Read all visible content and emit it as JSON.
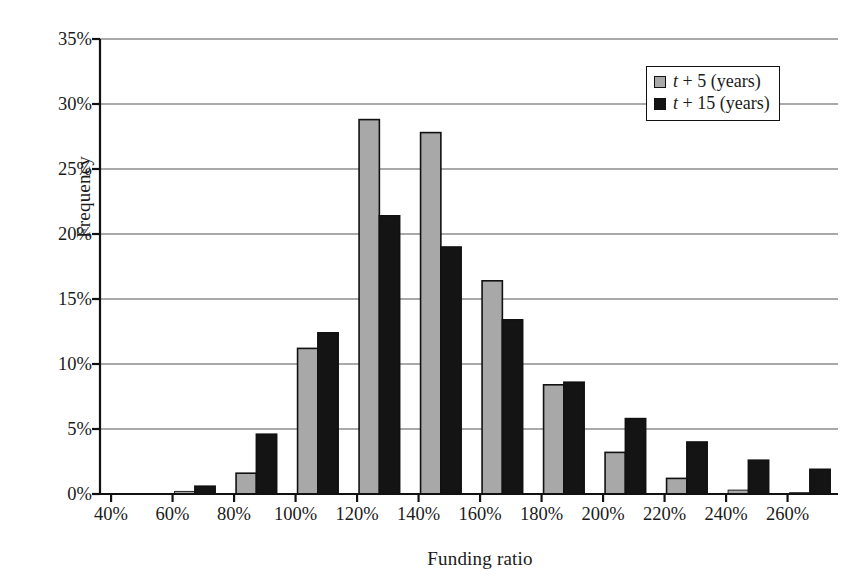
{
  "chart_data": {
    "type": "bar",
    "title": "",
    "xlabel": "Funding ratio",
    "ylabel": "Frequency",
    "categories": [
      "40%",
      "60%",
      "80%",
      "100%",
      "120%",
      "140%",
      "160%",
      "180%",
      "200%",
      "220%",
      "240%",
      "260%"
    ],
    "series": [
      {
        "name": "t + 5 (years)",
        "color": "#a8a8a8",
        "edge_color": "#111111",
        "values": [
          0.0,
          0.2,
          1.6,
          11.2,
          28.8,
          27.8,
          16.4,
          8.4,
          3.2,
          1.2,
          0.3,
          0.1
        ]
      },
      {
        "name": "t + 15 (years)",
        "color": "#141414",
        "edge_color": "#111111",
        "values": [
          0.0,
          0.6,
          4.6,
          12.4,
          21.4,
          19.0,
          13.4,
          8.6,
          5.8,
          4.0,
          2.6,
          1.9
        ]
      }
    ],
    "ylim": [
      0,
      35
    ],
    "ytick_values": [
      0,
      5,
      10,
      15,
      20,
      25,
      30,
      35
    ],
    "ytick_labels": [
      "0%",
      "5%",
      "10%",
      "15%",
      "20%",
      "25%",
      "30%",
      "35%"
    ],
    "grid": true,
    "grid_axis": "y",
    "legend_position": "upper-right",
    "value_unit": "%"
  },
  "legend": {
    "items": [
      {
        "label_prefix": "t",
        "label_rest": " + 5 (years)",
        "full": "t + 5 (years)",
        "swatch": "gray-swatch"
      },
      {
        "label_prefix": "t",
        "label_rest": " + 15 (years)",
        "full": "t + 15 (years)",
        "swatch": "black-swatch"
      }
    ]
  },
  "colors": {
    "series_1": "#a8a8a8",
    "series_2": "#141414",
    "axis": "#111111",
    "grid": "#555555",
    "background": "#ffffff"
  }
}
